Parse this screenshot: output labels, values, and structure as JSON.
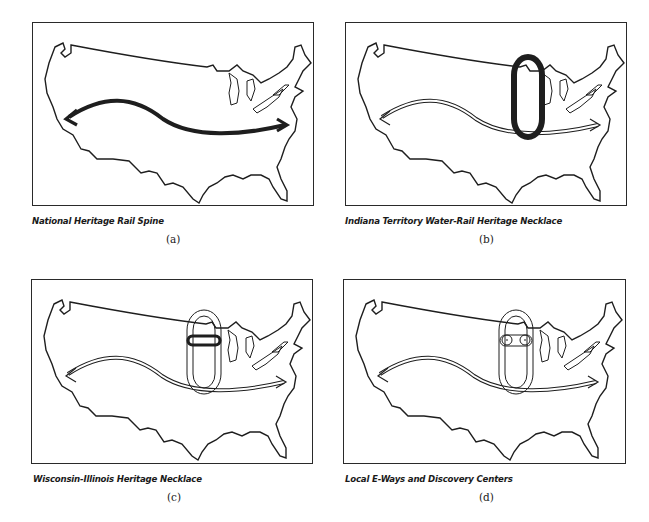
{
  "figure": {
    "panels": [
      {
        "id": "a",
        "caption": "National Heritage Rail Spine",
        "label": "(a)",
        "overlay": "rail-spine-bold"
      },
      {
        "id": "b",
        "caption": "Indiana Territory Water-Rail Heritage Necklace",
        "label": "(b)",
        "overlay": "indiana-necklace-bold"
      },
      {
        "id": "c",
        "caption": "Wisconsin-Illinois Heritage Necklace",
        "label": "(c)",
        "overlay": "wisconsin-illinois-necklace-bold"
      },
      {
        "id": "d",
        "caption": "Local E-Ways and Discovery Centers",
        "label": "(d)",
        "overlay": "local-eways-discovery-centers"
      }
    ],
    "colors": {
      "line": "#1e1e1e",
      "background": "#ffffff"
    }
  }
}
